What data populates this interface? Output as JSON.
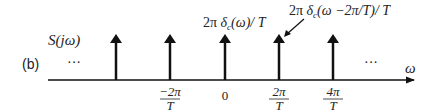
{
  "panel_label": "(b)",
  "function_label": "S(jω)",
  "axis_label": "ω",
  "ellipsis_left": "···",
  "ellipsis_right": "···",
  "impulse_label_center": "2π δc(ω)/T",
  "impulse_label_center_parts": {
    "pre": "2π ",
    "delta": "δ",
    "sub": "c",
    "post": "(ω)/ T"
  },
  "impulse_label_shifted": "2π δc(ω−2π/T)/T",
  "impulse_label_shifted_parts": {
    "pre": "2π ",
    "delta": "δ",
    "sub": "c",
    "post": "(ω −2π/T)/ T"
  },
  "ticks": [
    {
      "num": "−2π",
      "den": "T"
    },
    {
      "num": "0",
      "den": ""
    },
    {
      "num": "2π",
      "den": "T"
    },
    {
      "num": "4π",
      "den": "T"
    }
  ],
  "colors": {
    "line": "#111111",
    "text": "#222222"
  }
}
